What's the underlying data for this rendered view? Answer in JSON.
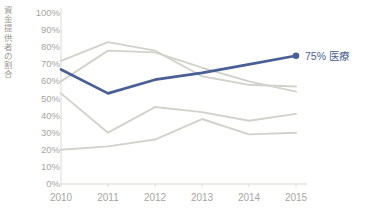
{
  "chart_data": {
    "type": "line",
    "title": "",
    "xlabel": "",
    "ylabel": "資金提供者の割合",
    "x": [
      "2010",
      "2011",
      "2012",
      "2013",
      "2014",
      "2015"
    ],
    "categories": [
      "2010",
      "2011",
      "2012",
      "2013",
      "2014",
      "2015"
    ],
    "ylim": [
      0,
      100
    ],
    "yticks": [
      "0%",
      "10%",
      "20%",
      "30%",
      "40%",
      "50%",
      "60%",
      "70%",
      "80%",
      "90%",
      "100%"
    ],
    "ytick_values": [
      0,
      10,
      20,
      30,
      40,
      50,
      60,
      70,
      80,
      90,
      100
    ],
    "grid": false,
    "legend": "none",
    "highlight_color": "#4a5f96",
    "muted_color": "#d2d2cc",
    "axis_color": "#d9d9d3",
    "tick_text_color": "#a6a6a0",
    "series": [
      {
        "name": "医療",
        "highlight": true,
        "color": "#4a5f96",
        "values": [
          67,
          53,
          61,
          65,
          70,
          75
        ],
        "end_marker": true,
        "end_label": "75% 医療"
      },
      {
        "name": "series-gray-1",
        "highlight": false,
        "color": "#d2d2cc",
        "values": [
          72,
          83,
          78,
          63,
          58,
          57
        ],
        "end_marker": false,
        "end_label": ""
      },
      {
        "name": "series-gray-2",
        "highlight": false,
        "color": "#d2d2cc",
        "values": [
          60,
          78,
          77,
          68,
          60,
          54
        ],
        "end_marker": false,
        "end_label": ""
      },
      {
        "name": "series-gray-3",
        "highlight": false,
        "color": "#d2d2cc",
        "values": [
          53,
          30,
          45,
          42,
          37,
          41
        ],
        "end_marker": false,
        "end_label": ""
      },
      {
        "name": "series-gray-4",
        "highlight": false,
        "color": "#d2d2cc",
        "values": [
          20,
          22,
          26,
          38,
          29,
          30
        ],
        "end_marker": false,
        "end_label": ""
      }
    ],
    "annotations": [
      {
        "text": "75% 医療",
        "series": "医療",
        "x": "2015",
        "y": 75
      }
    ]
  }
}
